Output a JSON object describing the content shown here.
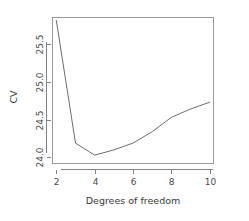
{
  "chart_data": {
    "type": "line",
    "title": "",
    "subtitle": "",
    "xlabel": "Degrees of freedom",
    "ylabel": "CV",
    "x": [
      2,
      3,
      4,
      5,
      6,
      7,
      8,
      9,
      10
    ],
    "values": [
      25.81,
      24.19,
      24.03,
      24.1,
      24.19,
      24.34,
      24.53,
      24.64,
      24.73
    ],
    "series": [
      {
        "name": "CV",
        "values": [
          25.81,
          24.19,
          24.03,
          24.1,
          24.19,
          24.34,
          24.53,
          24.64,
          24.73
        ]
      }
    ],
    "xlim": [
      1.8,
      10.2
    ],
    "ylim": [
      23.92,
      25.85
    ],
    "xticks": [
      2,
      4,
      6,
      8,
      10
    ],
    "xtick_labels": [
      "2",
      "4",
      "6",
      "8",
      "10"
    ],
    "yticks": [
      24.0,
      24.5,
      25.0,
      25.5
    ],
    "ytick_labels": [
      "24.0",
      "24.5",
      "25.0",
      "25.5"
    ],
    "grid": false,
    "legend": false,
    "legend_position": "none",
    "line_color": "#6e6e6e",
    "axis_color": "#838383",
    "background_color": "#ffffff",
    "annotations": []
  },
  "axes": {
    "x_title": "Degrees of freedom",
    "y_title": "CV"
  },
  "ticks": {
    "x": [
      {
        "label": "2",
        "value": 2
      },
      {
        "label": "4",
        "value": 4
      },
      {
        "label": "6",
        "value": 6
      },
      {
        "label": "8",
        "value": 8
      },
      {
        "label": "10",
        "value": 10
      }
    ],
    "y": [
      {
        "label": "24.0",
        "value": 24.0
      },
      {
        "label": "24.5",
        "value": 24.5
      },
      {
        "label": "25.0",
        "value": 25.0
      },
      {
        "label": "25.5",
        "value": 25.5
      }
    ]
  }
}
